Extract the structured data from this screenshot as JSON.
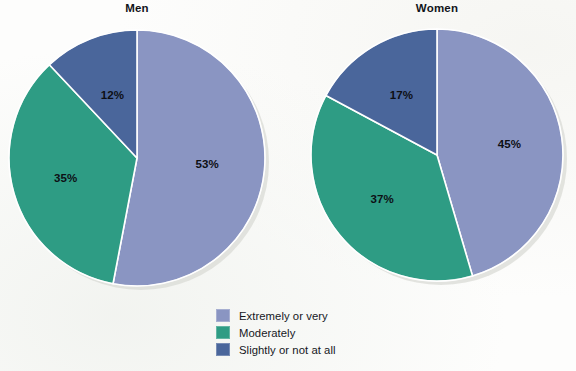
{
  "figure": {
    "background": "#fdfdfc",
    "label_color": "#0d0f14"
  },
  "palette": {
    "extremely_or_very": "#8a95c2",
    "moderately": "#2e9c84",
    "slightly_or_not_at_all": "#4a669b",
    "separator": "#ffffff",
    "shadow": "#d9dbd6"
  },
  "legend": {
    "position": "bottom-center",
    "items": [
      {
        "label": "Extremely or very",
        "color": "#8a95c2"
      },
      {
        "label": "Moderately",
        "color": "#2e9c84"
      },
      {
        "label": "Slightly or not at all",
        "color": "#4a669b"
      }
    ]
  },
  "charts": {
    "men": {
      "title": "Men",
      "labels": [
        "53%",
        "35%",
        "12%"
      ]
    },
    "women": {
      "title": "Women",
      "labels": [
        "45%",
        "37%",
        "17%"
      ]
    }
  },
  "chart_data": [
    {
      "type": "pie",
      "title": "Men",
      "categories": [
        "Extremely or very",
        "Moderately",
        "Slightly or not at all"
      ],
      "values": [
        53,
        35,
        12
      ],
      "data_labels": [
        "53%",
        "35%",
        "12%"
      ],
      "colors": [
        "#8a95c2",
        "#2e9c84",
        "#4a669b"
      ],
      "start_angle_deg": 0,
      "direction": "clockwise",
      "units": "percent",
      "legend_position": "bottom-center",
      "grid": false,
      "xlabel": "",
      "ylabel": ""
    },
    {
      "type": "pie",
      "title": "Women",
      "categories": [
        "Extremely or very",
        "Moderately",
        "Slightly or not at all"
      ],
      "values": [
        45,
        37,
        17
      ],
      "data_labels": [
        "45%",
        "37%",
        "17%"
      ],
      "colors": [
        "#8a95c2",
        "#2e9c84",
        "#4a669b"
      ],
      "start_angle_deg": 0,
      "direction": "clockwise",
      "units": "percent",
      "legend_position": "bottom-center",
      "grid": false,
      "xlabel": "",
      "ylabel": ""
    }
  ]
}
